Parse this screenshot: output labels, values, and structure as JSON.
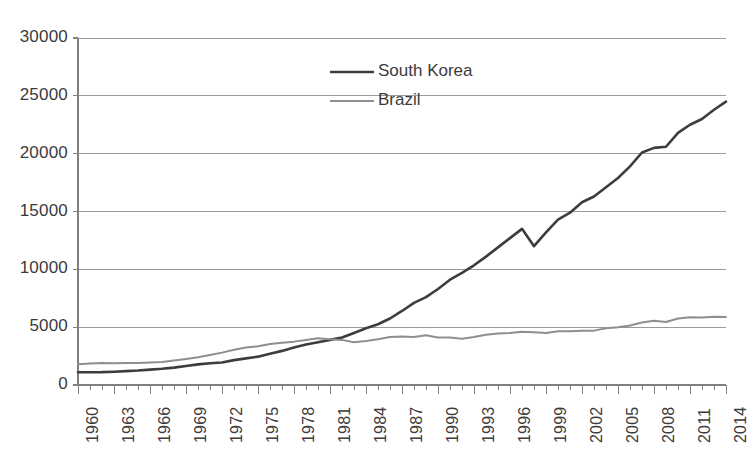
{
  "chart_data": {
    "type": "line",
    "title": "",
    "subtitle": "",
    "xlabel": "",
    "ylabel": "",
    "xlim": [
      1960,
      2014
    ],
    "ylim": [
      0,
      30000
    ],
    "ytick_step": 5000,
    "xtick_step": 1,
    "xlabel_step": 3,
    "grid": true,
    "grid_axis": "y",
    "legend_position": "inside-top-center",
    "yticks": [
      "0",
      "5000",
      "10000",
      "15000",
      "20000",
      "25000",
      "30000"
    ],
    "ytick_values": [
      0,
      5000,
      10000,
      15000,
      20000,
      25000,
      30000
    ],
    "xticks": [
      "1960",
      "1963",
      "1966",
      "1969",
      "1972",
      "1975",
      "1978",
      "1981",
      "1984",
      "1987",
      "1990",
      "1993",
      "1996",
      "1999",
      "2002",
      "2005",
      "2008",
      "2011",
      "2014"
    ],
    "x": [
      1960,
      1961,
      1962,
      1963,
      1964,
      1965,
      1966,
      1967,
      1968,
      1969,
      1970,
      1971,
      1972,
      1973,
      1974,
      1975,
      1976,
      1977,
      1978,
      1979,
      1980,
      1981,
      1982,
      1983,
      1984,
      1985,
      1986,
      1987,
      1988,
      1989,
      1990,
      1991,
      1992,
      1993,
      1994,
      1995,
      1996,
      1997,
      1998,
      1999,
      2000,
      2001,
      2002,
      2003,
      2004,
      2005,
      2006,
      2007,
      2008,
      2009,
      2010,
      2011,
      2012,
      2013,
      2014
    ],
    "series": [
      {
        "name": "South Korea",
        "color": "#3d3d3d",
        "width": 2.6,
        "values": [
          1100,
          1100,
          1110,
          1150,
          1200,
          1250,
          1330,
          1400,
          1500,
          1650,
          1780,
          1880,
          1950,
          2150,
          2300,
          2450,
          2700,
          2950,
          3250,
          3500,
          3700,
          3900,
          4100,
          4500,
          4900,
          5250,
          5750,
          6400,
          7100,
          7600,
          8300,
          9100,
          9700,
          10350,
          11100,
          11900,
          12700,
          13500,
          12000,
          13200,
          14300,
          14900,
          15800,
          16300,
          17100,
          17900,
          18900,
          20100,
          20500,
          20600,
          21800,
          22500,
          23000,
          23800,
          24500
        ]
      },
      {
        "name": "Brazil",
        "color": "#8f8f8f",
        "width": 2.0,
        "values": [
          1800,
          1850,
          1900,
          1880,
          1900,
          1900,
          1950,
          1990,
          2120,
          2250,
          2400,
          2600,
          2800,
          3050,
          3250,
          3350,
          3550,
          3650,
          3750,
          3900,
          4050,
          3950,
          3900,
          3700,
          3800,
          3950,
          4150,
          4200,
          4150,
          4300,
          4100,
          4100,
          4000,
          4150,
          4350,
          4450,
          4500,
          4600,
          4550,
          4500,
          4650,
          4650,
          4700,
          4700,
          4900,
          5000,
          5150,
          5400,
          5550,
          5450,
          5750,
          5850,
          5830,
          5900,
          5880
        ]
      }
    ]
  },
  "legend": {
    "items": [
      {
        "label": "South Korea",
        "color": "#3d3d3d"
      },
      {
        "label": "Brazil",
        "color": "#8f8f8f"
      }
    ]
  },
  "axis_style": {
    "axis_color": "#808080",
    "grid_color": "#9a9a9a",
    "text_color": "#3b3b3b",
    "background": "#ffffff"
  }
}
